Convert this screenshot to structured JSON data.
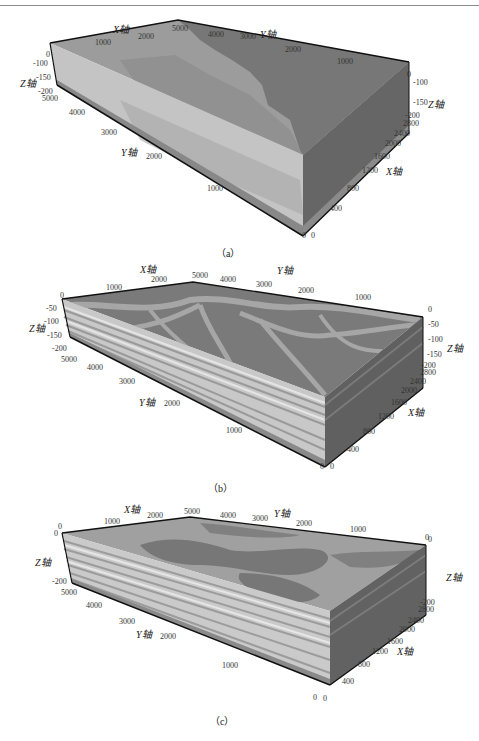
{
  "figure": {
    "panels": [
      {
        "id": "a",
        "caption": "（a）",
        "axes": {
          "x_title": "X轴",
          "y_title": "Y轴",
          "z_title": "Z轴",
          "x_ticks_back": [
            "1000",
            "2000"
          ],
          "y_ticks_back": [
            "5000",
            "4000",
            "3000",
            "2000",
            "1000",
            "0"
          ],
          "z_ticks_left": [
            "0",
            "-100",
            "-150",
            "-200"
          ],
          "z_ticks_right": [
            "-100",
            "-150",
            "-200"
          ],
          "y_ticks_front": [
            "5000",
            "4000",
            "3000",
            "2000",
            "1000",
            "0"
          ],
          "x_ticks_right": [
            "0",
            "400",
            "800",
            "1200",
            "1600",
            "2000",
            "2400",
            "2800"
          ]
        }
      },
      {
        "id": "b",
        "caption": "（b）",
        "axes": {
          "x_title": "X轴",
          "y_title": "Y轴",
          "z_title": "Z轴",
          "x_ticks_back": [
            "1000",
            "2000"
          ],
          "y_ticks_back": [
            "5000",
            "4000",
            "3000",
            "2000",
            "1000",
            "0"
          ],
          "z_ticks_left": [
            "0",
            "-50",
            "-100",
            "-150",
            "-200"
          ],
          "z_ticks_right": [
            "-50",
            "-100",
            "-150",
            "-200"
          ],
          "y_ticks_front": [
            "5000",
            "4000",
            "3000",
            "2000",
            "1000",
            "0"
          ],
          "x_ticks_right": [
            "0",
            "400",
            "800",
            "1200",
            "1600",
            "2000",
            "2400",
            "2800"
          ]
        }
      },
      {
        "id": "c",
        "caption": "（c）",
        "axes": {
          "x_title": "X轴",
          "y_title": "Y轴",
          "z_title": "Z轴",
          "x_ticks_back": [
            "1000",
            "2000"
          ],
          "y_ticks_back": [
            "5000",
            "4000",
            "3000",
            "2000",
            "1000",
            "0"
          ],
          "z_ticks_left": [
            "0",
            "0",
            "-200"
          ],
          "z_ticks_right": [
            "0",
            "-200"
          ],
          "y_ticks_front": [
            "5000",
            "4000",
            "3000",
            "2000",
            "1000",
            "0"
          ],
          "x_ticks_right": [
            "0",
            "400",
            "800",
            "1200",
            "1600",
            "2000",
            "2400",
            "2800"
          ]
        }
      }
    ],
    "colors": {
      "light_facies": "#c8c8c8",
      "mid_facies": "#9a9a9a",
      "dark_facies": "#707070",
      "side_dark": "#5a5a5a",
      "edge": "#111111"
    }
  }
}
